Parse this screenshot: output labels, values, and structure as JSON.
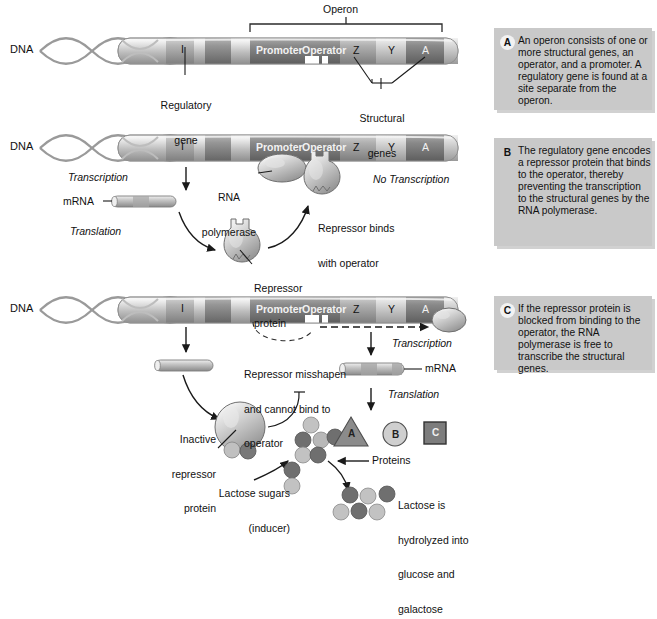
{
  "figure": {
    "dna_label": "DNA",
    "operon_label": "Operon"
  },
  "gene_map": {
    "regulatory_gene_letter": "I",
    "promoter": "Promoter",
    "operator": "Operator",
    "structural": [
      "Z",
      "Y",
      "A"
    ],
    "regulatory_caption_line1": "Regulatory",
    "regulatory_caption_line2": "gene",
    "structural_caption_line1": "Structural",
    "structural_caption_line2": "genes"
  },
  "panel_a": {
    "dna_label": "DNA"
  },
  "panel_b": {
    "dna_label": "DNA",
    "transcription": "Transcription",
    "translation": "Translation",
    "no_transcription": "No Transcription",
    "mrna": "mRNA",
    "rna_poly_line1": "RNA",
    "rna_poly_line2": "polymerase",
    "repressor_protein_line1": "Repressor",
    "repressor_protein_line2": "protein",
    "repressor_binds_line1": "Repressor binds",
    "repressor_binds_line2": "with operator"
  },
  "panel_c": {
    "dna_label": "DNA",
    "transcription": "Transcription",
    "translation": "Translation",
    "mrna": "mRNA",
    "misshapen_line1": "Repressor misshapen",
    "misshapen_line2": "and cannot bind to",
    "misshapen_line3": "operator",
    "inactive_line1": "Inactive",
    "inactive_line2": "repressor",
    "inactive_line3": "protein",
    "lactose_line1": "Lactose sugars",
    "lactose_line2": "(inducer)",
    "proteins_label": "Proteins",
    "protein_shapes": [
      {
        "name": "triangle",
        "letter": "A"
      },
      {
        "name": "circle",
        "letter": "B"
      },
      {
        "name": "square",
        "letter": "C"
      }
    ],
    "hydrolysis_line1": "Lactose is",
    "hydrolysis_line2": "hydrolyzed into",
    "hydrolysis_line3": "glucose and",
    "hydrolysis_line4": "galactose"
  },
  "legend": [
    {
      "key": "A",
      "text": "An operon consists of one or more structural genes, an operator, and a promoter. A regulatory gene is found at a site separate from the operon."
    },
    {
      "key": "B",
      "text": "The regulatory gene encodes a repressor protein that binds to the operator, thereby preventing the transcription to the structural genes by the RNA polymerase."
    },
    {
      "key": "C",
      "text": "If the repressor protein is blocked from binding to the operator, the RNA polymerase is free to transcribe the structural genes."
    }
  ],
  "colors": {
    "panel_bg": "#c9c9c9",
    "dna_light": "#d8d8d8",
    "dna_mid": "#b3b3b3",
    "dna_dark": "#808080",
    "dna_darker": "#6d6d6d",
    "stroke": "#222222",
    "sugar_dark": "#6e6e6e",
    "sugar_light": "#bdbdbd"
  }
}
